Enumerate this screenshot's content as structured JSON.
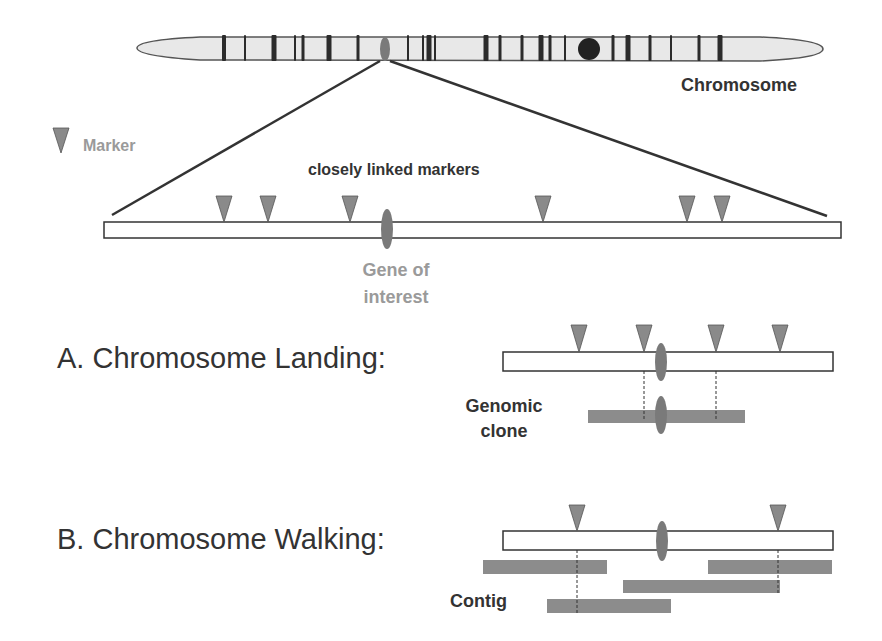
{
  "colors": {
    "background": "#ffffff",
    "chromosome_fill": "#e8e8e8",
    "chromosome_stroke": "#555555",
    "band": "#2b2b2b",
    "centromere": "#222222",
    "marker": "#8a8a8a",
    "gene": "#7a7a7a",
    "clone": "#8c8c8c",
    "dark_text": "#333333",
    "gray_text": "#9a9a9a",
    "line": "#333333"
  },
  "labels": {
    "chromosome": "Chromosome",
    "marker_legend": "Marker",
    "closely_linked": "closely linked markers",
    "gene_line1": "Gene of",
    "gene_line2": "interest",
    "section_a": "A. Chromosome Landing:",
    "genomic_line1": "Genomic",
    "genomic_line2": "clone",
    "section_b": "B. Chromosome Walking:",
    "contig": "Contig"
  },
  "chromosome": {
    "x1": 137,
    "x2": 823,
    "cy": 48,
    "half_height": 11,
    "bands": [
      {
        "x": 224,
        "w": 4
      },
      {
        "x": 245,
        "w": 2
      },
      {
        "x": 274,
        "w": 5
      },
      {
        "x": 295,
        "w": 2
      },
      {
        "x": 303,
        "w": 3
      },
      {
        "x": 329,
        "w": 5
      },
      {
        "x": 358,
        "w": 3
      },
      {
        "x": 408,
        "w": 2
      },
      {
        "x": 423,
        "w": 2
      },
      {
        "x": 429,
        "w": 5
      },
      {
        "x": 435,
        "w": 2
      },
      {
        "x": 486,
        "w": 5
      },
      {
        "x": 500,
        "w": 3
      },
      {
        "x": 522,
        "w": 3
      },
      {
        "x": 541,
        "w": 5
      },
      {
        "x": 550,
        "w": 3
      },
      {
        "x": 565,
        "w": 2
      },
      {
        "x": 613,
        "w": 3
      },
      {
        "x": 628,
        "w": 5
      },
      {
        "x": 650,
        "w": 3
      },
      {
        "x": 671,
        "w": 2
      },
      {
        "x": 699,
        "w": 3
      },
      {
        "x": 720,
        "w": 5
      }
    ],
    "gene_locus": {
      "cx": 385,
      "cy": 49,
      "rx": 5,
      "ry": 12
    },
    "centromere": {
      "cx": 589,
      "cy": 49,
      "r": 11
    }
  },
  "zoom_lines": [
    {
      "x1": 380,
      "y1": 61,
      "x2": 112,
      "y2": 215
    },
    {
      "x1": 390,
      "y1": 61,
      "x2": 827,
      "y2": 216
    }
  ],
  "legend_marker": {
    "x1": 53,
    "x2": 69,
    "y1": 128,
    "y2": 153
  },
  "region": {
    "bar": {
      "x": 104,
      "y": 222,
      "w": 737,
      "h": 16
    },
    "markers": [
      224,
      268,
      350,
      543,
      687,
      722
    ],
    "marker_top": 196,
    "gene": {
      "cx": 387,
      "cy": 229,
      "rx": 6,
      "ry": 20
    }
  },
  "landing": {
    "bar": {
      "x": 503,
      "y": 352,
      "w": 330,
      "h": 19
    },
    "markers": [
      579,
      644,
      716,
      780
    ],
    "marker_top": 325,
    "gene": {
      "cx": 661,
      "cy": 362,
      "rx": 6,
      "ry": 19
    },
    "dashes": [
      644,
      716
    ],
    "dash_y1": 371,
    "dash_y2": 420,
    "clone": {
      "x": 588,
      "y": 410,
      "w": 157,
      "h": 13
    },
    "clone_gene": {
      "cx": 661,
      "cy": 415,
      "rx": 6,
      "ry": 19
    }
  },
  "walking": {
    "bar": {
      "x": 503,
      "y": 531,
      "w": 330,
      "h": 19
    },
    "markers": [
      577,
      778
    ],
    "marker_top": 505,
    "gene": {
      "cx": 662,
      "cy": 541,
      "rx": 6,
      "ry": 20
    },
    "dashes": [
      {
        "x": 577,
        "y2": 613
      },
      {
        "x": 778,
        "y2": 593
      }
    ],
    "dash_y1": 550,
    "contigs": [
      {
        "x": 483,
        "y": 560,
        "w": 124,
        "h": 14
      },
      {
        "x": 708,
        "y": 560,
        "w": 124,
        "h": 14
      },
      {
        "x": 623,
        "y": 580,
        "w": 157,
        "h": 13
      },
      {
        "x": 547,
        "y": 599,
        "w": 124,
        "h": 14
      }
    ]
  }
}
